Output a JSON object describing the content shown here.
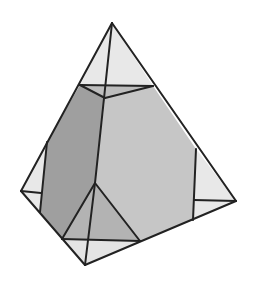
{
  "diagram": {
    "title": "",
    "colors": {
      "background": "#ffffff",
      "edge": "#222222",
      "corner_face": "#e6e6e6",
      "face_light": "#c9c9c9",
      "face_dark": "#9a9a9a",
      "face_mid": "#b5b5b5",
      "top_inner": "#bcbcbc"
    },
    "vertices": {
      "apex": [
        112,
        23
      ],
      "left": [
        21,
        191
      ],
      "bottom": [
        85,
        265
      ],
      "right": [
        236,
        201
      ],
      "top_tri_left": [
        80,
        85
      ],
      "top_tri_right": [
        153,
        86
      ],
      "top_tri_front": [
        105,
        98
      ],
      "inner": [
        95,
        183
      ],
      "bot_tri_left": [
        62,
        239
      ],
      "bot_tri_right": [
        140,
        241
      ],
      "bot_tri_bottom": [
        88,
        258
      ],
      "left_tri_top": [
        47,
        142
      ],
      "left_tri_bottom": [
        40,
        212
      ],
      "left_tri_inner": [
        41,
        193
      ],
      "right_tri_top": [
        196,
        149
      ],
      "right_tri_bottom": [
        193,
        220
      ],
      "right_tri_inner": [
        194,
        200
      ]
    }
  }
}
